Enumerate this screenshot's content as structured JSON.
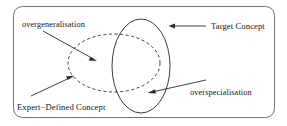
{
  "figure": {
    "title": "Expert-Defined Concept versus Target Concept overlap diagram",
    "background_color": "#ffffff",
    "frame": {
      "name": "rounded-border",
      "stroke_color": "#6f6f6f",
      "x": 13,
      "y": 6,
      "width": 262,
      "height": 112,
      "corner_radius": 9
    },
    "shapes": [
      {
        "name": "expert-defined-concept-ellipse",
        "style": "dashed",
        "stroke_color": "#3c3c3c",
        "cx": 114,
        "cy": 63,
        "rx": 46,
        "ry": 29
      },
      {
        "name": "target-concept-ellipse",
        "style": "solid",
        "stroke_color": "#3c3c3c",
        "cx": 141,
        "cy": 66,
        "rx": 29,
        "ry": 47
      }
    ],
    "labels": {
      "overgeneralisation": "overgeneralisation",
      "target_concept": "Target Concept",
      "expert_defined_concept": "Expert−Defined Concept",
      "overspecialisation": "overspecialisation"
    },
    "annotations": [
      {
        "name": "overgeneralisation-pointer",
        "label_key": "overgeneralisation",
        "from": [
          43,
          31
        ],
        "to": [
          97,
          61
        ],
        "points_at": "region inside dashed ellipse outside solid ellipse"
      },
      {
        "name": "target-concept-pointer",
        "label_key": "target_concept",
        "from": [
          206,
          26
        ],
        "to": [
          169,
          26
        ],
        "points_at": "solid ellipse boundary"
      },
      {
        "name": "expert-defined-concept-pointer",
        "label_key": "expert_defined_concept",
        "from": [
          31,
          96
        ],
        "to": [
          74,
          76
        ],
        "points_at": "dashed ellipse boundary"
      },
      {
        "name": "overspecialisation-pointer",
        "label_key": "overspecialisation",
        "from": [
          206,
          80
        ],
        "to": [
          148,
          93
        ],
        "points_at": "region inside solid ellipse outside dashed ellipse"
      }
    ]
  }
}
